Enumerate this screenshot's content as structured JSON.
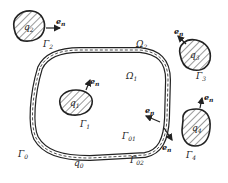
{
  "figure": {
    "regions": {
      "omega1": {
        "base": "Ω",
        "sub": "1"
      },
      "omega2": {
        "base": "Ω",
        "sub": "2"
      }
    },
    "outer_boundary": {
      "gamma0": {
        "base": "Γ",
        "sub": "0"
      },
      "gamma01": {
        "base": "Γ",
        "sub": "01"
      },
      "gamma02": {
        "base": "Γ",
        "sub": "02"
      },
      "q0": {
        "base": "q",
        "sub": "0"
      }
    },
    "sources": [
      {
        "id": "1",
        "q_base": "q",
        "q_sub": "1",
        "g_base": "Γ",
        "g_sub": "1"
      },
      {
        "id": "2",
        "q_base": "q",
        "q_sub": "2",
        "g_base": "Γ",
        "g_sub": "2"
      },
      {
        "id": "3",
        "q_base": "q",
        "q_sub": "3",
        "g_base": "Γ",
        "g_sub": "3"
      },
      {
        "id": "4",
        "q_base": "q",
        "q_sub": "4",
        "g_base": "Γ",
        "g_sub": "4"
      }
    ],
    "normal": {
      "base": "e",
      "sub": "n"
    }
  }
}
